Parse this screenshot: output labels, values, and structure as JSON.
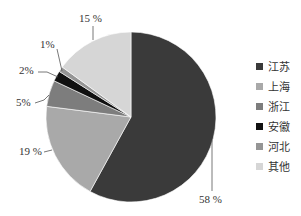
{
  "chart_data": {
    "type": "pie",
    "title": "",
    "categories": [
      "江苏",
      "上海",
      "浙江",
      "安徽",
      "河北",
      "其他"
    ],
    "values": [
      58,
      19,
      5,
      2,
      1,
      15
    ],
    "value_labels": [
      "58 %",
      "19 %",
      "5%",
      "2%",
      "1%",
      "15 %"
    ],
    "colors": [
      "#3a3a3a",
      "#a9a9a9",
      "#7d7d7d",
      "#111111",
      "#959595",
      "#d6d6d6"
    ],
    "start_angle_deg": 0,
    "direction": "clockwise",
    "legend_position": "right"
  },
  "legend": {
    "items": [
      {
        "label": "江苏",
        "color": "#3a3a3a"
      },
      {
        "label": "上海",
        "color": "#a9a9a9"
      },
      {
        "label": "浙江",
        "color": "#7d7d7d"
      },
      {
        "label": "安徽",
        "color": "#111111"
      },
      {
        "label": "河北",
        "color": "#959595"
      },
      {
        "label": "其他",
        "color": "#d6d6d6"
      }
    ]
  },
  "labels": {
    "jiangsu": "58 %",
    "shanghai": "19 %",
    "zhejiang": "5%",
    "anhui": "2%",
    "hebei": "1%",
    "other": "15 %"
  }
}
